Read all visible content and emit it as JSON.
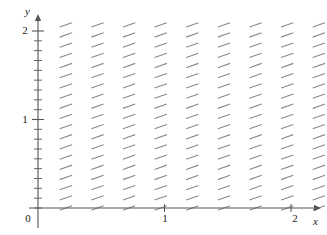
{
  "figure": {
    "kind": "slope-field",
    "width": 327,
    "height": 235,
    "background_color": "#ffffff"
  },
  "axes": {
    "x_axis_label": "x",
    "y_axis_label": "y",
    "origin_label": "0",
    "x_tick_labels": [
      "1",
      "2"
    ],
    "y_tick_labels": [
      "1",
      "2"
    ],
    "axis_color": "#555555",
    "arrowheads": true
  },
  "chart_data": {
    "type": "scatter",
    "title": "",
    "xlabel": "x",
    "ylabel": "y",
    "xlim": [
      0,
      2.28
    ],
    "ylim": [
      0,
      2.18
    ],
    "x_ticks": [
      1,
      2
    ],
    "y_ticks": [
      1,
      2
    ],
    "y_minor_tick_count": 18,
    "grid": false,
    "legend": null,
    "field": {
      "description": "Direction field of a first-order ODE; every segment has the same positive slope, independent of x and y.",
      "slope_value": 0.35,
      "segment_color": "#8a8a8a",
      "segment_length_px": 13,
      "columns_x": [
        0.22,
        0.47,
        0.72,
        0.97,
        1.22,
        1.47,
        1.72,
        1.97,
        2.22
      ],
      "rows_y": [
        0.0,
        0.115,
        0.23,
        0.345,
        0.46,
        0.575,
        0.69,
        0.805,
        0.92,
        1.035,
        1.15,
        1.265,
        1.38,
        1.495,
        1.61,
        1.725,
        1.84,
        1.955,
        2.07
      ],
      "column_count": 9,
      "row_count": 19
    }
  }
}
